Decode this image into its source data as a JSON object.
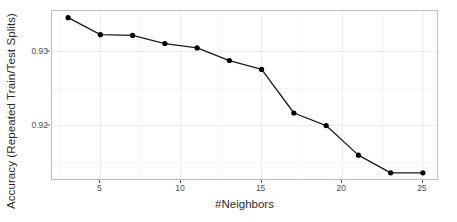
{
  "chart_data": {
    "type": "line",
    "title": "",
    "xlabel": "#Neighbors",
    "ylabel": "Accuracy (Repeated Train/Test Splits)",
    "x": [
      3,
      5,
      7,
      9,
      11,
      13,
      15,
      17,
      19,
      21,
      23,
      25
    ],
    "values": [
      0.9346,
      0.9323,
      0.9322,
      0.9311,
      0.9305,
      0.9288,
      0.9276,
      0.9217,
      0.92,
      0.916,
      0.9136,
      0.9136
    ],
    "series": [
      {
        "name": "knn-accuracy",
        "values": [
          0.9346,
          0.9323,
          0.9322,
          0.9311,
          0.9305,
          0.9288,
          0.9276,
          0.9217,
          0.92,
          0.916,
          0.9136,
          0.9136
        ]
      }
    ],
    "xlim": [
      2,
      26
    ],
    "ylim": [
      0.9125,
      0.9355
    ],
    "xticks": [
      5,
      10,
      15,
      20,
      25
    ],
    "xtick_labels": [
      "5",
      "10",
      "15",
      "20",
      "25"
    ],
    "yticks": [
      0.92,
      0.93
    ],
    "ytick_labels": [
      "0.92",
      "0.93"
    ],
    "x_minor_ticks": [
      2.5,
      7.5,
      12.5,
      17.5,
      22.5
    ],
    "y_minor_ticks": [
      0.915,
      0.925,
      0.935
    ],
    "grid": true,
    "legend": "none",
    "colors": {
      "line": "#1a1a1a",
      "point": "#000000",
      "panel_background": "#ffffff",
      "panel_border": "#bdbdbd",
      "grid_major": "#ededed",
      "grid_minor": "#f6f6f6",
      "axis_text": "#4d4d4d",
      "axis_title": "#2b2b2b"
    },
    "point_size": 2.6,
    "line_width": 1.3
  }
}
